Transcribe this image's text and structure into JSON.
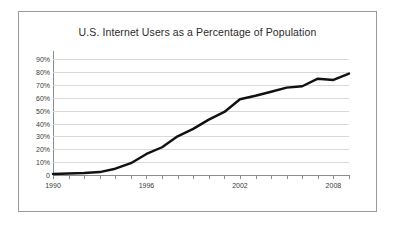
{
  "chart_data": {
    "type": "line",
    "title": "U.S. Internet Users as a Percentage of Population",
    "xlabel": "",
    "ylabel": "",
    "xlim": [
      1990,
      2009
    ],
    "ylim": [
      0,
      95
    ],
    "grid": true,
    "legend": "none",
    "line_color": "#111111",
    "x_tick_labels": [
      "1990",
      "1996",
      "2002",
      "2008"
    ],
    "x_tick_label_years": [
      1990,
      1996,
      2002,
      2008
    ],
    "x_minor_tick_years": [
      1990,
      1991,
      1992,
      1993,
      1994,
      1995,
      1996,
      1997,
      1998,
      1999,
      2000,
      2001,
      2002,
      2003,
      2004,
      2005,
      2006,
      2007,
      2008,
      2009
    ],
    "y_tick_labels": [
      "90%",
      "80%",
      "70%",
      "60%",
      "50%",
      "40%",
      "30%",
      "20%",
      "10%",
      "0"
    ],
    "y_tick_values": [
      90,
      80,
      70,
      60,
      50,
      40,
      30,
      20,
      10,
      0
    ],
    "series": [
      {
        "name": "U.S. Internet Users (% of population)",
        "x": [
          1990,
          1991,
          1992,
          1993,
          1994,
          1995,
          1996,
          1997,
          1998,
          1999,
          2000,
          2001,
          2002,
          2003,
          2004,
          2005,
          2006,
          2007,
          2008,
          2009
        ],
        "values": [
          0.8,
          1.2,
          1.5,
          2.3,
          4.9,
          9.2,
          16.4,
          21.6,
          30.1,
          35.9,
          43.1,
          49.1,
          59.0,
          61.7,
          64.8,
          68.0,
          69.1,
          75.0,
          74.0,
          79.0
        ]
      }
    ]
  }
}
